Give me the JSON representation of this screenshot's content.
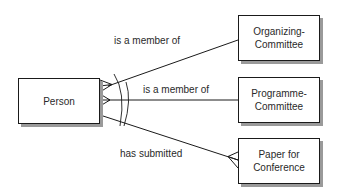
{
  "diagram": {
    "type": "entity-relationship",
    "entities": [
      {
        "id": "person",
        "label": "Person"
      },
      {
        "id": "organizing",
        "label": "Organizing-\nCommittee"
      },
      {
        "id": "programme",
        "label": "Programme-\nCommittee"
      },
      {
        "id": "paper",
        "label": "Paper for\nConference"
      }
    ],
    "relationships": [
      {
        "from": "person",
        "to": "organizing",
        "label": "is a member of",
        "cardinality_from": "many",
        "cardinality_to": "one"
      },
      {
        "from": "person",
        "to": "programme",
        "label": "is a member of",
        "cardinality_from": "many",
        "cardinality_to": "one"
      },
      {
        "from": "person",
        "to": "paper",
        "label": "has submitted",
        "cardinality_from": "one",
        "cardinality_to": "many"
      }
    ],
    "constraint": {
      "type": "exclusive-arc",
      "spans": [
        "organizing",
        "programme"
      ]
    },
    "colors": {
      "line": "#1a1a1a",
      "text": "#2a2a2a",
      "shadow": "#9a9a9a",
      "background": "#ffffff"
    }
  }
}
